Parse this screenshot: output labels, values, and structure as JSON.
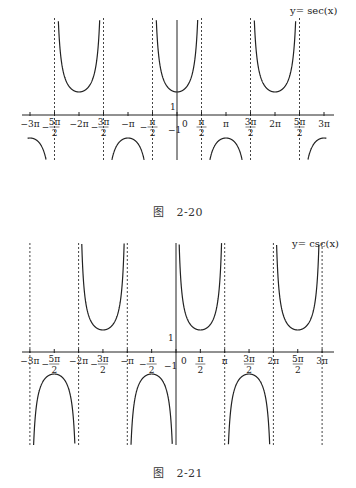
{
  "chart_data": [
    {
      "type": "line",
      "title": "y = sec(x)",
      "function": "sec",
      "caption": {
        "prefix": "图",
        "number": "2-20"
      },
      "xlabel": "",
      "ylabel": "",
      "x_range": [
        "-3π",
        "3π"
      ],
      "y_range_visible": [
        -5,
        5
      ],
      "grid": false,
      "x_ticks": [
        "-3π",
        "-5π/2",
        "-2π",
        "-3π/2",
        "-π",
        "-π/2",
        "0",
        "π/2",
        "π",
        "3π/2",
        "2π",
        "5π/2",
        "3π"
      ],
      "y_ticks": [
        "1",
        "-1"
      ],
      "asymptotes": [
        "-5π/2",
        "-3π/2",
        "-π/2",
        "π/2",
        "3π/2",
        "5π/2"
      ],
      "local_minima": [
        {
          "x": "-2π",
          "y": 1
        },
        {
          "x": "0",
          "y": 1
        },
        {
          "x": "2π",
          "y": 1
        }
      ],
      "local_maxima": [
        {
          "x": "-3π",
          "y": -1
        },
        {
          "x": "-π",
          "y": -1
        },
        {
          "x": "π",
          "y": -1
        },
        {
          "x": "3π",
          "y": -1
        }
      ]
    },
    {
      "type": "line",
      "title": "y = csc(x)",
      "function": "csc",
      "caption": {
        "prefix": "图",
        "number": "2-21"
      },
      "xlabel": "",
      "ylabel": "",
      "x_range": [
        "-3π",
        "3π"
      ],
      "y_range_visible": [
        -5,
        5
      ],
      "grid": false,
      "x_ticks": [
        "-3π",
        "-5π/2",
        "-2π",
        "-3π/2",
        "-π",
        "-π/2",
        "0",
        "π/2",
        "π",
        "3π/2",
        "2π",
        "5π/2",
        "3π"
      ],
      "y_ticks": [
        "1",
        "-1"
      ],
      "asymptotes": [
        "-3π",
        "-2π",
        "-π",
        "0",
        "π",
        "2π",
        "3π"
      ],
      "local_minima": [
        {
          "x": "-3π/2",
          "y": 1
        },
        {
          "x": "π/2",
          "y": 1
        },
        {
          "x": "5π/2",
          "y": 1
        }
      ],
      "local_maxima": [
        {
          "x": "-5π/2",
          "y": -1
        },
        {
          "x": "-π/2",
          "y": -1
        },
        {
          "x": "3π/2",
          "y": -1
        }
      ]
    }
  ],
  "fig1": {
    "title": "y= sec(x)",
    "caption_prefix": "图",
    "caption_number": "2-20"
  },
  "fig2": {
    "title": "y= csc(x)",
    "caption_prefix": "图",
    "caption_number": "2-21"
  },
  "ticks": {
    "m3pi": "−3π",
    "m5pi2_num": "5π",
    "m2pi": "−2π",
    "m3pi2_num": "3π",
    "mpi": "−π",
    "mpi2_num": "π",
    "zero": "0",
    "pi2_num": "π",
    "pi": "π",
    "3pi2_num": "3π",
    "2pi": "2π",
    "5pi2_num": "5π",
    "3pi": "3π",
    "den": "2",
    "minus": "−",
    "one": "1",
    "neg_one": "−1"
  }
}
